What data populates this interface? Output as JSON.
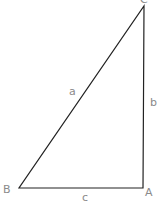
{
  "diagram": {
    "type": "right-triangle",
    "vertices": [
      {
        "label": "A",
        "x": 143,
        "y": 188
      },
      {
        "label": "B",
        "x": 19,
        "y": 188
      },
      {
        "label": "C",
        "x": 144,
        "y": 6
      }
    ],
    "sides": [
      {
        "label": "a",
        "from": "B",
        "to": "C"
      },
      {
        "label": "b",
        "from": "A",
        "to": "C"
      },
      {
        "label": "c",
        "from": "B",
        "to": "A"
      }
    ],
    "colors": {
      "line": "#222222",
      "label": "#8a8a8a",
      "background": "#ffffff"
    }
  }
}
